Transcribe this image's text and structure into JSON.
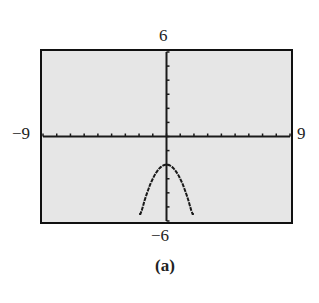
{
  "figure": {
    "caption": "(a)",
    "label_top": "6",
    "label_bottom": "−6",
    "label_left": "−9",
    "label_right": "9"
  },
  "chart_data": {
    "type": "line",
    "title": "",
    "xlabel": "",
    "ylabel": "",
    "xlim": [
      -9,
      9
    ],
    "ylim": [
      -6,
      6
    ],
    "xscale_tick": 1,
    "yscale_tick": 1,
    "grid": false,
    "series": [
      {
        "name": "y = -x^2 - 2",
        "x": [
          -2,
          -1.5,
          -1,
          -0.5,
          0,
          0.5,
          1,
          1.5,
          2
        ],
        "y": [
          -6,
          -4.25,
          -3,
          -2.25,
          -2,
          -2.25,
          -3,
          -4.25,
          -6
        ]
      }
    ],
    "colors": {
      "background": "#e6e6e6",
      "axis": "#1a1a1a",
      "curve": "#1a1a1a"
    }
  }
}
